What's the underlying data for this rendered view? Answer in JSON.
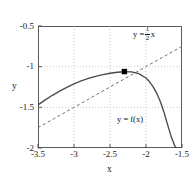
{
  "chart_data": {
    "type": "line",
    "title": "",
    "xlabel": "x",
    "ylabel": "y",
    "xlim": [
      -3.5,
      -1.5
    ],
    "ylim": [
      -2,
      -0.5
    ],
    "xticks": [
      "-3.5",
      "-3",
      "-2.5",
      "-2",
      "-1.5"
    ],
    "xtick_values": [
      -3.5,
      -3,
      -2.5,
      -2,
      -1.5
    ],
    "yticks": [
      "-2",
      "-1.5",
      "-1",
      "-0.5"
    ],
    "ytick_values": [
      -2,
      -1.5,
      -1,
      -0.5
    ],
    "grid": true,
    "grid_style": "dotted",
    "legend_position": "inline-annotation",
    "series": [
      {
        "name": "y = f(x)",
        "style": "solid",
        "color": "#4a4a4a",
        "x": [
          -3.5,
          -3.4,
          -3.3,
          -3.2,
          -3.1,
          -3.0,
          -2.9,
          -2.8,
          -2.7,
          -2.6,
          -2.5,
          -2.4,
          -2.3,
          -2.2,
          -2.1,
          -2.0,
          -1.95,
          -1.9,
          -1.85,
          -1.8,
          -1.75,
          -1.7,
          -1.65,
          -1.6,
          -1.58
        ],
        "y": [
          -1.47,
          -1.408,
          -1.352,
          -1.3,
          -1.254,
          -1.212,
          -1.176,
          -1.145,
          -1.119,
          -1.098,
          -1.081,
          -1.069,
          -1.062,
          -1.064,
          -1.085,
          -1.14,
          -1.186,
          -1.248,
          -1.329,
          -1.432,
          -1.56,
          -1.712,
          -1.86,
          -1.975,
          -2.0
        ]
      },
      {
        "name": "y = 1/2 x",
        "style": "dashed",
        "color": "#6e6e6e",
        "x": [
          -3.5,
          -1.5
        ],
        "y": [
          -1.75,
          -0.75
        ]
      }
    ],
    "points": [
      {
        "name": "tangency-point",
        "x": -2.3,
        "y": -1.06,
        "marker": "square",
        "color": "#000000"
      }
    ],
    "annotations": [
      {
        "name": "line-equation",
        "text_prefix": "y =",
        "numerator": "1",
        "denominator": "2",
        "text_suffix": "x",
        "x": -1.95,
        "y": -0.72
      },
      {
        "name": "function-equation",
        "text": "y = f(x)",
        "x": -2.05,
        "y": -1.62
      }
    ]
  }
}
